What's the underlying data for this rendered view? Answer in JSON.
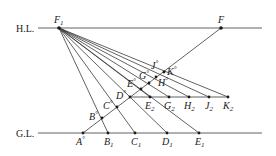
{
  "diagram": {
    "horizon_line_label": "H.L.",
    "ground_line_label": "G.L.",
    "points": {
      "F1": {
        "base": "F",
        "sub": "1"
      },
      "F": {
        "base": "F",
        "sub": ""
      },
      "A": {
        "base": "A",
        "sup": "°"
      },
      "B": {
        "base": "B",
        "sup": "°"
      },
      "C": {
        "base": "C",
        "sup": "°"
      },
      "D": {
        "base": "D",
        "sup": "°"
      },
      "E": {
        "base": "E",
        "sup": "°"
      },
      "G": {
        "base": "G",
        "sup": "°"
      },
      "H": {
        "base": "H",
        "sup": "°"
      },
      "J": {
        "base": "J",
        "sup": "°"
      },
      "K": {
        "base": "K",
        "sup": "°"
      },
      "B1": {
        "base": "B",
        "sub": "1"
      },
      "C1": {
        "base": "C",
        "sub": "1"
      },
      "D1": {
        "base": "D",
        "sub": "1"
      },
      "E1": {
        "base": "E",
        "sub": "1"
      },
      "E2": {
        "base": "E",
        "sub": "2"
      },
      "G2": {
        "base": "G",
        "sub": "2"
      },
      "H2": {
        "base": "H",
        "sub": "2"
      },
      "J2": {
        "base": "J",
        "sub": "2"
      },
      "K2": {
        "base": "K",
        "sub": "2"
      }
    }
  }
}
